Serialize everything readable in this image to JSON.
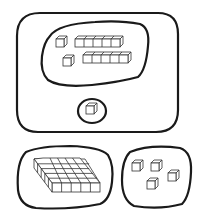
{
  "diagram": {
    "description": "Base-ten blocks grouped with hand-drawn loops",
    "groups": [
      {
        "id": "outer-group",
        "label": "Outer rounded rectangle group",
        "contains": [
          "inner-rods-group",
          "single-unit-group"
        ]
      },
      {
        "id": "inner-rods-group",
        "label": "2 rods and 2 unit cubes",
        "rods": 2,
        "units": 2,
        "cubes_per_rod_visible": 5
      },
      {
        "id": "single-unit-group",
        "label": "1 unit cube",
        "units": 1
      },
      {
        "id": "flat-group",
        "label": "1 flat (5 x 5)",
        "flats": 1,
        "flat_rows": 5,
        "flat_cols": 5
      },
      {
        "id": "loose-units-group",
        "label": "4 unit cubes",
        "units": 4
      }
    ],
    "colors": {
      "stroke": "#1a1a1a",
      "cube_stroke": "#333333",
      "fill": "#ffffff"
    }
  }
}
